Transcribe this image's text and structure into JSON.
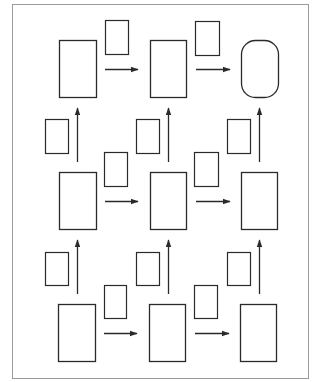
{
  "diagram": {
    "type": "grid-flow",
    "rows": 3,
    "columns": 3,
    "main_boxes": [
      {
        "id": "r1c1",
        "x": 59,
        "y": 40,
        "w": 37,
        "h": 57,
        "shape": "rect"
      },
      {
        "id": "r1c2",
        "x": 150,
        "y": 40,
        "w": 36,
        "h": 57,
        "shape": "rect"
      },
      {
        "id": "r1c3",
        "x": 241,
        "y": 40,
        "w": 37,
        "h": 57,
        "shape": "rounded"
      },
      {
        "id": "r2c1",
        "x": 59,
        "y": 172,
        "w": 37,
        "h": 57,
        "shape": "rect"
      },
      {
        "id": "r2c2",
        "x": 150,
        "y": 172,
        "w": 36,
        "h": 57,
        "shape": "rect"
      },
      {
        "id": "r2c3",
        "x": 241,
        "y": 172,
        "w": 36,
        "h": 57,
        "shape": "rect"
      },
      {
        "id": "r3c1",
        "x": 58,
        "y": 304,
        "w": 37,
        "h": 57,
        "shape": "rect"
      },
      {
        "id": "r3c2",
        "x": 149,
        "y": 304,
        "w": 36,
        "h": 57,
        "shape": "rect"
      },
      {
        "id": "r3c3",
        "x": 240,
        "y": 304,
        "w": 36,
        "h": 57,
        "shape": "rect"
      }
    ],
    "small_boxes": [
      {
        "id": "h-r1-1",
        "x": 105,
        "y": 20,
        "w": 23,
        "h": 34
      },
      {
        "id": "h-r1-2",
        "x": 195,
        "y": 21,
        "w": 24,
        "h": 34
      },
      {
        "id": "h-r2-1",
        "x": 104,
        "y": 152,
        "w": 23,
        "h": 34
      },
      {
        "id": "h-r2-2",
        "x": 194,
        "y": 152,
        "w": 24,
        "h": 34
      },
      {
        "id": "h-r3-1",
        "x": 104,
        "y": 285,
        "w": 22,
        "h": 33
      },
      {
        "id": "h-r3-2",
        "x": 194,
        "y": 285,
        "w": 23,
        "h": 33
      },
      {
        "id": "v-u-1",
        "x": 45,
        "y": 119,
        "w": 23,
        "h": 34
      },
      {
        "id": "v-u-2",
        "x": 136,
        "y": 119,
        "w": 23,
        "h": 34
      },
      {
        "id": "v-u-3",
        "x": 227,
        "y": 119,
        "w": 23,
        "h": 34
      },
      {
        "id": "v-l-1",
        "x": 45,
        "y": 252,
        "w": 23,
        "h": 33
      },
      {
        "id": "v-l-2",
        "x": 136,
        "y": 252,
        "w": 23,
        "h": 33
      },
      {
        "id": "v-l-3",
        "x": 227,
        "y": 252,
        "w": 23,
        "h": 33
      }
    ],
    "h_arrows": [
      {
        "x1": 105,
        "x2": 138,
        "y": 69
      },
      {
        "x1": 196,
        "x2": 230,
        "y": 69
      },
      {
        "x1": 105,
        "x2": 138,
        "y": 201
      },
      {
        "x1": 196,
        "x2": 230,
        "y": 201
      },
      {
        "x1": 104,
        "x2": 137,
        "y": 333
      },
      {
        "x1": 195,
        "x2": 229,
        "y": 333
      }
    ],
    "v_arrows": [
      {
        "x": 77,
        "y1": 162,
        "y2": 108
      },
      {
        "x": 168,
        "y1": 162,
        "y2": 108
      },
      {
        "x": 259,
        "y1": 162,
        "y2": 108
      },
      {
        "x": 77,
        "y1": 294,
        "y2": 240
      },
      {
        "x": 168,
        "y1": 294,
        "y2": 240
      },
      {
        "x": 259,
        "y1": 294,
        "y2": 240
      }
    ],
    "stroke_color": "#2a2a2a",
    "frame_color": "#9a9a9a"
  }
}
